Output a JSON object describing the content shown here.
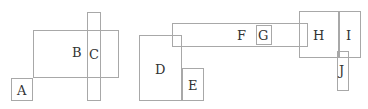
{
  "diagram": {
    "stroke_color": "#a8a8a8",
    "boxes": [
      {
        "id": "A",
        "x": 11,
        "y": 78,
        "w": 22,
        "h": 23,
        "lx": 17,
        "ly": 84
      },
      {
        "id": "B",
        "x": 33,
        "y": 30,
        "w": 86,
        "h": 48,
        "lx": 72,
        "ly": 46
      },
      {
        "id": "C",
        "x": 87,
        "y": 12,
        "w": 14,
        "h": 89,
        "lx": 89,
        "ly": 48
      },
      {
        "id": "D",
        "x": 139,
        "y": 35,
        "w": 43,
        "h": 66,
        "lx": 155,
        "ly": 63
      },
      {
        "id": "E",
        "x": 182,
        "y": 68,
        "w": 22,
        "h": 33,
        "lx": 188,
        "ly": 79
      },
      {
        "id": "F",
        "x": 172,
        "y": 23,
        "w": 136,
        "h": 24,
        "lx": 237,
        "ly": 29
      },
      {
        "id": "G",
        "x": 256,
        "y": 25,
        "w": 16,
        "h": 20,
        "lx": 258,
        "ly": 29
      },
      {
        "id": "H",
        "x": 299,
        "y": 11,
        "w": 40,
        "h": 47,
        "lx": 313,
        "ly": 29
      },
      {
        "id": "I",
        "x": 339,
        "y": 11,
        "w": 22,
        "h": 47,
        "lx": 346,
        "ly": 29
      },
      {
        "id": "J",
        "x": 337,
        "y": 51,
        "w": 12,
        "h": 40,
        "lx": 339,
        "ly": 64
      }
    ]
  }
}
